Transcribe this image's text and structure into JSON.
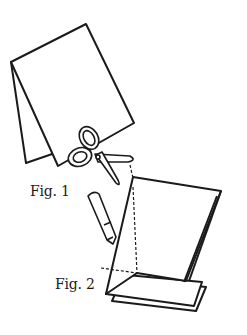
{
  "figures": {
    "fig1_label": "Fig. 1",
    "fig2_label": "Fig. 2"
  },
  "elements": {
    "fig1": "folded-paper-with-scissors",
    "fig2": "folded-paper-with-cut-lines",
    "pencil": "pencil-icon",
    "scissors": "scissors-icon"
  },
  "colors": {
    "stroke": "#1a1a1a",
    "background": "#ffffff"
  }
}
